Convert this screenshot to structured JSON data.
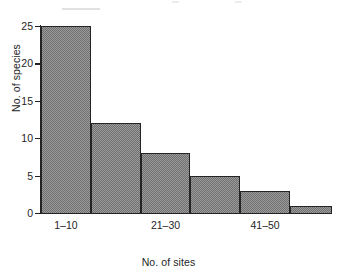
{
  "chart_data": {
    "type": "bar",
    "title": "",
    "subtitle": "",
    "xlabel": "No. of sites",
    "ylabel": "No. of species",
    "categories": [
      "1–10",
      "11–20",
      "21–30",
      "31–40",
      "41–50",
      "51–60"
    ],
    "values": [
      25,
      12,
      8,
      5,
      3,
      1
    ],
    "visible_xtick_labels": [
      "1–10",
      "21–30",
      "41–50"
    ],
    "visible_xtick_category_indexes": [
      0,
      2,
      4
    ],
    "yticks": [
      0,
      5,
      10,
      15,
      20,
      25
    ],
    "ylim": [
      0,
      25
    ],
    "grid": false,
    "legend": false,
    "legend_position": "none",
    "bar_fill": "#9b9b9b",
    "bar_fill_pattern": "checkerboard-stipple",
    "bar_edge_color": "#242424",
    "axis_color": "#232323",
    "background": "#ffffff"
  },
  "axes": {
    "y": {
      "title": "No. of species",
      "ticks": [
        {
          "value": 25,
          "label": "25"
        },
        {
          "value": 20,
          "label": "20"
        },
        {
          "value": 15,
          "label": "15"
        },
        {
          "value": 10,
          "label": "10"
        },
        {
          "value": 5,
          "label": "5"
        },
        {
          "value": 0,
          "label": "0"
        }
      ]
    },
    "x": {
      "title": "No. of sites",
      "ticks": [
        {
          "index": 0,
          "label": "1–10"
        },
        {
          "index": 2,
          "label": "21–30"
        },
        {
          "index": 4,
          "label": "41–50"
        }
      ]
    }
  }
}
